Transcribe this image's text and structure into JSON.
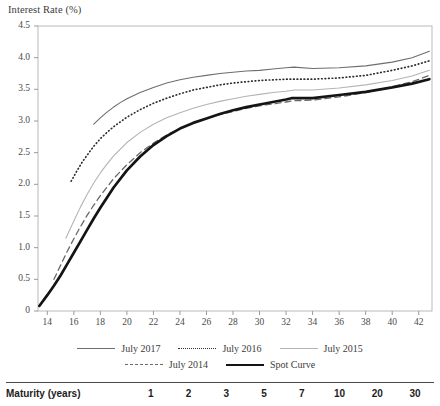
{
  "chart_data": {
    "type": "line",
    "title": "Interest Rate (%)",
    "xlabel": "",
    "ylabel": "Interest Rate (%)",
    "xlim": [
      13.3,
      43.0
    ],
    "ylim": [
      0,
      4.5
    ],
    "grid": false,
    "legend_position": "below-axis",
    "y_ticks": [
      "4.5",
      "4.0",
      "3.5",
      "3.0",
      "2.5",
      "2.0",
      "1.5",
      "1.0",
      "0.5",
      "0"
    ],
    "y_tick_values": [
      4.5,
      4.0,
      3.5,
      3.0,
      2.5,
      2.0,
      1.5,
      1.0,
      0.5,
      0
    ],
    "x_ticks": [
      "14",
      "16",
      "18",
      "20",
      "22",
      "24",
      "26",
      "28",
      "30",
      "32",
      "34",
      "36",
      "38",
      "40",
      "42"
    ],
    "x_tick_values": [
      14,
      16,
      18,
      20,
      22,
      24,
      26,
      28,
      30,
      32,
      34,
      36,
      38,
      40,
      42
    ],
    "series": [
      {
        "name": "July 2017",
        "style": "solid-dark",
        "color": "#6e6e6e",
        "x": [
          17.5,
          18.0,
          18.5,
          19.0,
          19.5,
          20.0,
          21.0,
          22.0,
          23.0,
          24.0,
          25.0,
          26.0,
          27.0,
          28.0,
          29.0,
          30.0,
          31.0,
          32.0,
          32.6,
          34.0,
          36.0,
          38.0,
          40.0,
          41.5,
          42.8
        ],
        "values": [
          2.95,
          3.05,
          3.14,
          3.22,
          3.29,
          3.35,
          3.45,
          3.53,
          3.6,
          3.65,
          3.69,
          3.72,
          3.75,
          3.77,
          3.79,
          3.8,
          3.82,
          3.84,
          3.85,
          3.83,
          3.84,
          3.87,
          3.93,
          4.0,
          4.1
        ]
      },
      {
        "name": "July 2016",
        "style": "dotted",
        "color": "#2f2f2f",
        "x": [
          15.8,
          16.2,
          16.6,
          17.0,
          17.5,
          18.0,
          18.5,
          19.0,
          20.0,
          21.0,
          22.0,
          23.0,
          24.0,
          25.0,
          26.0,
          27.0,
          28.0,
          29.0,
          30.0,
          31.0,
          32.0,
          33.0,
          34.0,
          36.0,
          38.0,
          40.0,
          41.5,
          42.8
        ],
        "values": [
          2.05,
          2.2,
          2.34,
          2.46,
          2.6,
          2.72,
          2.82,
          2.91,
          3.06,
          3.18,
          3.28,
          3.36,
          3.43,
          3.49,
          3.53,
          3.57,
          3.6,
          3.62,
          3.64,
          3.65,
          3.66,
          3.66,
          3.66,
          3.68,
          3.72,
          3.8,
          3.87,
          3.95
        ]
      },
      {
        "name": "July 2015",
        "style": "solid-light",
        "color": "#b4b4b4",
        "x": [
          15.4,
          16.0,
          16.5,
          17.0,
          17.5,
          18.0,
          18.5,
          19.0,
          20.0,
          21.0,
          22.0,
          23.0,
          24.0,
          25.0,
          26.0,
          27.0,
          28.0,
          29.0,
          30.0,
          31.0,
          32.0,
          32.6,
          34.0,
          36.0,
          38.0,
          40.0,
          41.5,
          42.8
        ],
        "values": [
          1.15,
          1.42,
          1.64,
          1.84,
          2.02,
          2.18,
          2.32,
          2.45,
          2.66,
          2.82,
          2.95,
          3.05,
          3.13,
          3.2,
          3.26,
          3.31,
          3.35,
          3.39,
          3.42,
          3.45,
          3.47,
          3.49,
          3.49,
          3.52,
          3.57,
          3.64,
          3.71,
          3.8
        ]
      },
      {
        "name": "July 2014",
        "style": "dashed",
        "color": "#6a6a6a",
        "x": [
          14.5,
          15.0,
          15.5,
          16.0,
          16.5,
          17.0,
          17.5,
          18.0,
          19.0,
          20.0,
          21.0,
          22.0,
          23.0,
          24.0,
          25.0,
          26.0,
          27.0,
          28.0,
          29.0,
          30.0,
          31.0,
          32.0,
          32.6,
          34.0,
          36.0,
          38.0,
          40.0,
          41.5,
          42.8
        ],
        "values": [
          0.5,
          0.72,
          0.94,
          1.14,
          1.33,
          1.51,
          1.67,
          1.82,
          2.09,
          2.31,
          2.5,
          2.65,
          2.78,
          2.88,
          2.97,
          3.04,
          3.1,
          3.15,
          3.2,
          3.24,
          3.27,
          3.3,
          3.32,
          3.33,
          3.38,
          3.45,
          3.54,
          3.62,
          3.72
        ]
      },
      {
        "name": "Spot Curve",
        "style": "thick",
        "color": "#141414",
        "x": [
          13.4,
          14.0,
          14.5,
          15.0,
          15.5,
          16.0,
          16.5,
          17.0,
          17.5,
          18.0,
          19.0,
          20.0,
          21.0,
          22.0,
          23.0,
          24.0,
          25.0,
          26.0,
          27.0,
          28.0,
          29.0,
          30.0,
          31.0,
          32.0,
          32.4,
          34.0,
          36.0,
          38.0,
          40.0,
          41.5,
          42.8
        ],
        "values": [
          0.08,
          0.25,
          0.4,
          0.56,
          0.74,
          0.92,
          1.1,
          1.28,
          1.46,
          1.63,
          1.95,
          2.22,
          2.44,
          2.62,
          2.76,
          2.88,
          2.97,
          3.04,
          3.11,
          3.17,
          3.22,
          3.26,
          3.3,
          3.34,
          3.36,
          3.36,
          3.41,
          3.46,
          3.53,
          3.59,
          3.66
        ]
      }
    ]
  },
  "legend": {
    "rows": [
      [
        {
          "label": "July 2017",
          "style": "solid-dark"
        },
        {
          "label": "July 2016",
          "style": "dotted"
        },
        {
          "label": "July 2015",
          "style": "solid-light"
        }
      ],
      [
        {
          "label": "July 2014",
          "style": "dashed"
        },
        {
          "label": "Spot Curve",
          "style": "thick"
        }
      ]
    ]
  },
  "table": {
    "row_label": "Maturity (years)",
    "columns": [
      "1",
      "2",
      "3",
      "5",
      "7",
      "10",
      "20",
      "30"
    ]
  }
}
